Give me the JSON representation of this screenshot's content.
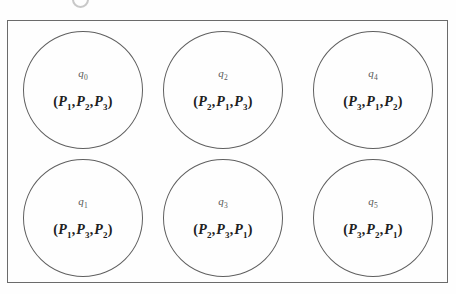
{
  "figure": {
    "kind": "state-diagram",
    "frame_border_color": "#6b6b6b",
    "circle_border_color": "#5f5f5f",
    "background_color": "#fefefe",
    "state_label_color": "#585858",
    "tuple_text_color": "#202020",
    "grid": {
      "rows": 2,
      "columns": 3,
      "order": "column-major"
    },
    "states": [
      {
        "id": "q0",
        "name_base": "q",
        "name_sub": "0",
        "open_paren": "(",
        "close_paren": ")",
        "separator": ",",
        "items": [
          {
            "base": "P",
            "sub": "1"
          },
          {
            "base": "P",
            "sub": "2"
          },
          {
            "base": "P",
            "sub": "3"
          }
        ],
        "column": 0,
        "row": 0
      },
      {
        "id": "q1",
        "name_base": "q",
        "name_sub": "1",
        "open_paren": "(",
        "close_paren": ")",
        "separator": ",",
        "items": [
          {
            "base": "P",
            "sub": "1"
          },
          {
            "base": "P",
            "sub": "3"
          },
          {
            "base": "P",
            "sub": "2"
          }
        ],
        "column": 0,
        "row": 1
      },
      {
        "id": "q2",
        "name_base": "q",
        "name_sub": "2",
        "open_paren": "(",
        "close_paren": ")",
        "separator": ",",
        "items": [
          {
            "base": "P",
            "sub": "2"
          },
          {
            "base": "P",
            "sub": "1"
          },
          {
            "base": "P",
            "sub": "3"
          }
        ],
        "column": 1,
        "row": 0
      },
      {
        "id": "q3",
        "name_base": "q",
        "name_sub": "3",
        "open_paren": "(",
        "close_paren": ")",
        "separator": ",",
        "items": [
          {
            "base": "P",
            "sub": "2"
          },
          {
            "base": "P",
            "sub": "3"
          },
          {
            "base": "P",
            "sub": "1"
          }
        ],
        "column": 1,
        "row": 1
      },
      {
        "id": "q4",
        "name_base": "q",
        "name_sub": "4",
        "open_paren": "(",
        "close_paren": ")",
        "separator": ",",
        "items": [
          {
            "base": "P",
            "sub": "3"
          },
          {
            "base": "P",
            "sub": "1"
          },
          {
            "base": "P",
            "sub": "2"
          }
        ],
        "column": 2,
        "row": 0
      },
      {
        "id": "q5",
        "name_base": "q",
        "name_sub": "5",
        "open_paren": "(",
        "close_paren": ")",
        "separator": ",",
        "items": [
          {
            "base": "P",
            "sub": "3"
          },
          {
            "base": "P",
            "sub": "2"
          },
          {
            "base": "P",
            "sub": "1"
          }
        ],
        "column": 2,
        "row": 1
      }
    ]
  }
}
